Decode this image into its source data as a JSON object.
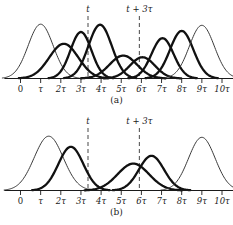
{
  "figure": {
    "background_color": "#ffffff",
    "ink_color": "#111111",
    "thin_curve_color": "#3a3a3a",
    "dash_color": "#5a5a5a"
  },
  "axis": {
    "tick_labels": [
      "0",
      "τ",
      "2τ",
      "3τ",
      "4τ",
      "5τ",
      "6τ",
      "7τ",
      "8τ",
      "9τ",
      "10τ"
    ],
    "tick_values": [
      0,
      1,
      2,
      3,
      4,
      5,
      6,
      7,
      8,
      9,
      10
    ],
    "range": [
      -0.8,
      10.9
    ],
    "unit_symbol": "τ"
  },
  "markers": [
    {
      "id": "marker-t",
      "label": "t",
      "x": 3.35
    },
    {
      "id": "marker-t-plus-3tau",
      "label": "t + 3τ",
      "x": 5.9
    }
  ],
  "panels": [
    {
      "id": "panel-a",
      "caption": "(a)",
      "chart_data": {
        "type": "line",
        "title": "(a)",
        "xlabel": "",
        "ylabel": "",
        "xlim": [
          -0.8,
          10.9
        ],
        "ylim": [
          0,
          1.05
        ],
        "grid": false,
        "legend": "none",
        "annotations": [
          "t",
          "t + 3τ"
        ],
        "series": [
          {
            "name": "gaussian-1",
            "style": "thin",
            "center": 1.0,
            "sigma": 0.62,
            "amplitude": 0.97
          },
          {
            "name": "gaussian-2",
            "style": "thick",
            "center": 2.15,
            "sigma": 0.72,
            "amplitude": 0.62
          },
          {
            "name": "gaussian-3",
            "style": "thick",
            "center": 3.0,
            "sigma": 0.52,
            "amplitude": 0.83
          },
          {
            "name": "gaussian-4",
            "style": "thick",
            "center": 3.95,
            "sigma": 0.58,
            "amplitude": 0.96
          },
          {
            "name": "gaussian-5",
            "style": "thick",
            "center": 5.1,
            "sigma": 0.68,
            "amplitude": 0.41
          },
          {
            "name": "gaussian-6",
            "style": "thick",
            "center": 6.05,
            "sigma": 0.62,
            "amplitude": 0.38
          },
          {
            "name": "gaussian-7",
            "style": "thick",
            "center": 7.05,
            "sigma": 0.55,
            "amplitude": 0.72
          },
          {
            "name": "gaussian-8",
            "style": "thick",
            "center": 8.0,
            "sigma": 0.58,
            "amplitude": 0.85
          },
          {
            "name": "gaussian-9",
            "style": "thin",
            "center": 9.0,
            "sigma": 0.62,
            "amplitude": 0.95
          }
        ]
      }
    },
    {
      "id": "panel-b",
      "caption": "(b)",
      "chart_data": {
        "type": "line",
        "title": "(b)",
        "xlabel": "",
        "ylabel": "",
        "xlim": [
          -0.8,
          10.9
        ],
        "ylim": [
          0,
          1.05
        ],
        "grid": false,
        "legend": "none",
        "annotations": [
          "t",
          "t + 3τ"
        ],
        "series": [
          {
            "name": "gaussian-1",
            "style": "thin",
            "center": 1.4,
            "sigma": 0.72,
            "amplitude": 0.97
          },
          {
            "name": "gaussian-2",
            "style": "thick",
            "center": 2.5,
            "sigma": 0.62,
            "amplitude": 0.78
          },
          {
            "name": "gaussian-3",
            "style": "thick",
            "center": 5.6,
            "sigma": 0.78,
            "amplitude": 0.48
          },
          {
            "name": "gaussian-4",
            "style": "thick",
            "center": 6.5,
            "sigma": 0.62,
            "amplitude": 0.62
          },
          {
            "name": "gaussian-5",
            "style": "thin",
            "center": 9.0,
            "sigma": 0.66,
            "amplitude": 0.95
          }
        ]
      }
    }
  ]
}
